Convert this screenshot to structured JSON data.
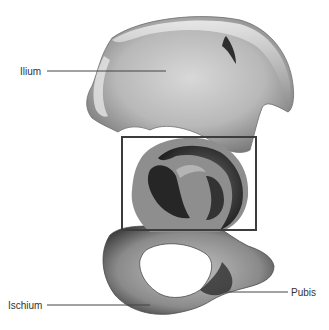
{
  "labels": {
    "ilium": "Ilium",
    "ischium": "Ischium",
    "pubis": "Pubis"
  },
  "highlight": "acetabulum region",
  "colors": {
    "background": "#ffffff",
    "bone_light": "#d4d4d4",
    "bone_mid": "#9a9a9a",
    "bone_dark": "#3a3a3a",
    "leader_line": "#444444",
    "highlight_box": "#3c3c3c"
  }
}
